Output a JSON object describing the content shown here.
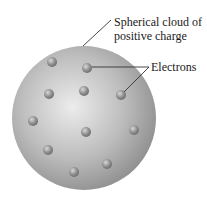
{
  "diagram": {
    "labels": {
      "sphere_line1": "Spherical cloud of",
      "sphere_line2": "positive charge",
      "electrons": "Electrons"
    },
    "colors": {
      "sphere_light": "#e6e6e6",
      "sphere_dark": "#8e8e8e",
      "electron": "#8a8a8a",
      "leader_line": "#333333"
    },
    "sphere": {
      "cx": 84,
      "cy": 118,
      "r": 72
    },
    "electrons": [
      {
        "x": 52,
        "y": 62
      },
      {
        "x": 87,
        "y": 68
      },
      {
        "x": 49,
        "y": 94
      },
      {
        "x": 84,
        "y": 91
      },
      {
        "x": 121,
        "y": 95
      },
      {
        "x": 33,
        "y": 121
      },
      {
        "x": 86,
        "y": 132
      },
      {
        "x": 134,
        "y": 130
      },
      {
        "x": 48,
        "y": 150
      },
      {
        "x": 107,
        "y": 164
      },
      {
        "x": 74,
        "y": 172
      }
    ]
  }
}
